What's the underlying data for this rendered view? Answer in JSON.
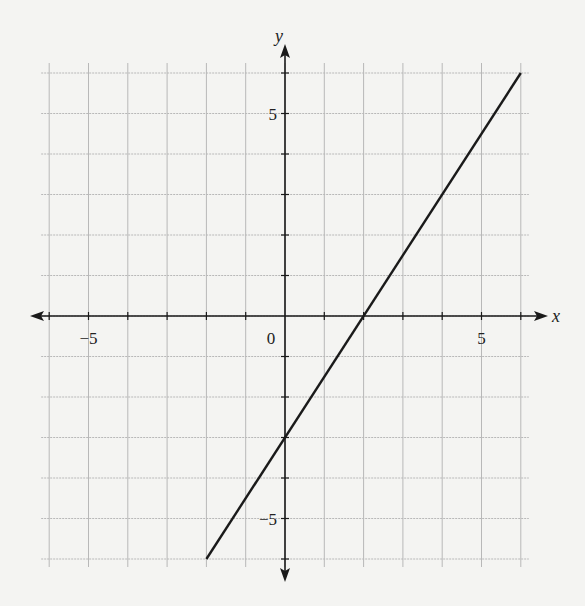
{
  "chart_data": {
    "type": "line",
    "title": "",
    "xlabel": "x",
    "ylabel": "y",
    "xlim": [
      -6,
      6
    ],
    "ylim": [
      -6,
      6
    ],
    "grid": true,
    "x_tick_labels": [
      {
        "value": -5,
        "label": "−5"
      },
      {
        "value": 0,
        "label": "0"
      },
      {
        "value": 5,
        "label": "5"
      }
    ],
    "y_tick_labels": [
      {
        "value": 5,
        "label": "5"
      },
      {
        "value": -5,
        "label": "−5"
      }
    ],
    "series": [
      {
        "name": "line",
        "equation": "y = 1.5x - 3",
        "slope": 1.5,
        "intercept": -3,
        "x": [
          -2,
          6
        ],
        "y": [
          -6,
          6
        ],
        "color": "#1a1a1a"
      }
    ],
    "annotations": {
      "x_intercept": [
        2,
        0
      ],
      "y_intercept": [
        0,
        -3
      ]
    }
  },
  "colors": {
    "grid": "#b8b8b8",
    "axis": "#1a1a1a",
    "line": "#1a1a1a",
    "background": "#f4f4f2"
  }
}
